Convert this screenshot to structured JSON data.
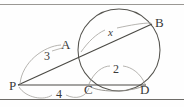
{
  "figure": {
    "background_color": "#fefefe",
    "stroke_color": "#55544f",
    "light_stroke_color": "#9a9894",
    "label_color": "#3a3a3a",
    "points": [
      {
        "id": "A",
        "label": "A",
        "x": 80,
        "y": 54,
        "label_x": 61,
        "label_y": 38
      },
      {
        "id": "B",
        "label": "B",
        "x": 152,
        "y": 24,
        "label_x": 155,
        "label_y": 16
      },
      {
        "id": "P",
        "label": "P",
        "x": 18,
        "y": 85,
        "label_x": 9,
        "label_y": 79
      },
      {
        "id": "C",
        "label": "C",
        "x": 90,
        "y": 85,
        "label_x": 84,
        "label_y": 83
      },
      {
        "id": "D",
        "label": "D",
        "x": 146,
        "y": 85,
        "label_x": 140,
        "label_y": 83
      }
    ],
    "measures": [
      {
        "id": "PA",
        "label": "3",
        "label_x": 44,
        "label_y": 50
      },
      {
        "id": "PC",
        "label": "4",
        "label_x": 56,
        "label_y": 88
      },
      {
        "id": "CD",
        "label": "2",
        "label_x": 113,
        "label_y": 63
      },
      {
        "id": "AB",
        "label": "x",
        "label_x": 110,
        "label_y": 28
      }
    ],
    "circle": {
      "cx": 119,
      "cy": 50,
      "r": 41
    },
    "segments": [
      {
        "id": "secant-P-B",
        "x1": 18,
        "y1": 85,
        "x2": 152,
        "y2": 24
      },
      {
        "id": "secant-P-D",
        "x1": 18,
        "y1": 85,
        "x2": 146,
        "y2": 85
      }
    ],
    "rules": [
      {
        "id": "top-rule",
        "y": 4
      },
      {
        "id": "bottom-rule",
        "y": 99
      }
    ]
  }
}
